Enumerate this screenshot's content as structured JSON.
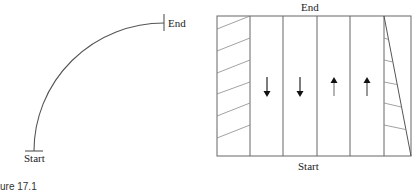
{
  "figure": {
    "caption": "ure 17.1"
  },
  "left_diagram": {
    "description": "curved path",
    "start_label": "Start",
    "end_label": "End",
    "arc": {
      "from": [
        34,
        151
      ],
      "to": [
        164,
        23
      ],
      "rx": 130,
      "ry": 128
    }
  },
  "right_diagram": {
    "description": "strip layout with alternating pass directions",
    "top_label": "End",
    "bottom_label": "Start",
    "strips": [
      {
        "type": "hatched",
        "direction": "none"
      },
      {
        "type": "pass",
        "direction": "down"
      },
      {
        "type": "pass",
        "direction": "down"
      },
      {
        "type": "pass",
        "direction": "up"
      },
      {
        "type": "pass",
        "direction": "up"
      },
      {
        "type": "hatched-triangle",
        "direction": "none"
      }
    ]
  },
  "colors": {
    "line": "#555555",
    "hatch": "#888888",
    "arrow": "#111111"
  }
}
